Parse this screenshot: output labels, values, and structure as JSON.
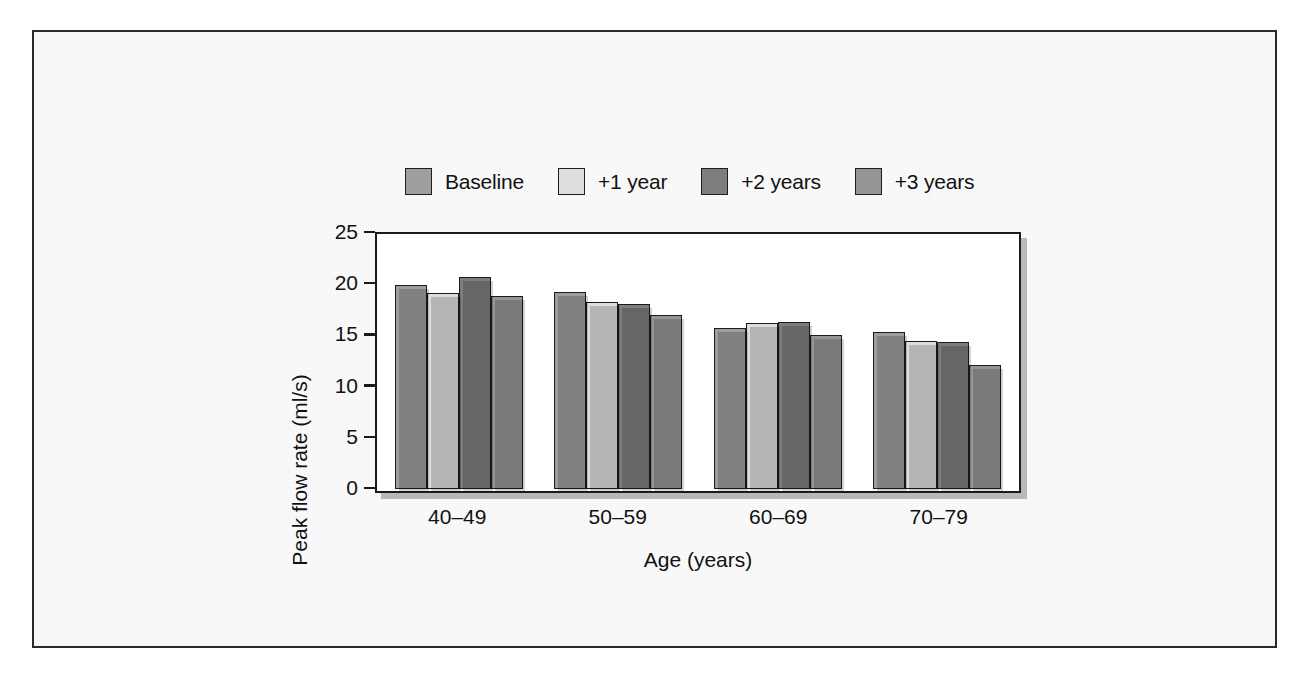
{
  "figure": {
    "frame_border_color": "#2a2a2a",
    "background_color": "#fbfbfb"
  },
  "chart_data": {
    "type": "bar",
    "title": "",
    "subtitle": "",
    "xlabel": "Age (years)",
    "ylabel": "Peak flow rate (ml/s)",
    "categories": [
      "40–49",
      "50–59",
      "60–69",
      "70–79"
    ],
    "series": [
      {
        "name": "Baseline",
        "color": "#9e9e9e",
        "values": [
          19.9,
          19.2,
          15.7,
          15.3
        ]
      },
      {
        "name": "+1 year",
        "color": "#dddddd",
        "values": [
          19.1,
          18.2,
          16.2,
          14.4
        ]
      },
      {
        "name": "+2 years",
        "color": "#7d7d7d",
        "values": [
          20.7,
          18.0,
          16.3,
          14.3
        ]
      },
      {
        "name": "+3 years",
        "color": "#959595",
        "values": [
          18.8,
          16.9,
          15.0,
          12.1
        ]
      }
    ],
    "ylim": [
      0,
      25
    ],
    "yticks": [
      0,
      5,
      10,
      15,
      20,
      25
    ],
    "ytick_labels": [
      "0",
      "5",
      "10",
      "15",
      "20",
      "25"
    ],
    "xtick_labels": [
      "40–49",
      "50–59",
      "60–69",
      "70–79"
    ],
    "grid": false,
    "legend_position": "above-plot",
    "legend_entries": [
      "Baseline",
      "+1 year",
      "+2 years",
      "+3 years"
    ]
  }
}
